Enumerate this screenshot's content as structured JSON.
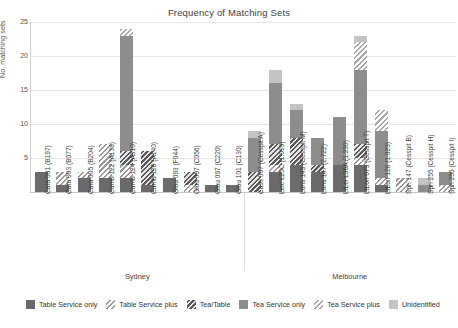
{
  "chart_data": {
    "type": "bar",
    "title": "Frequency of Matching Sets",
    "xlabel": "",
    "ylabel": "No. matching sets",
    "ylim": [
      0,
      25
    ],
    "yticks": [
      5,
      10,
      15,
      20,
      25
    ],
    "grid": true,
    "stacked": true,
    "legend_position": "bottom",
    "groups": [
      {
        "name": "Sydney",
        "start": 0,
        "end": 9
      },
      {
        "name": "Melbourne",
        "start": 10,
        "end": 19
      }
    ],
    "categories": [
      "Cara 001 (B197)",
      "Cara 003 (B077)",
      "Cara 005 (B204)",
      "Cumb 122 (A138)",
      "Cumb 124 (A310)",
      "Cumb 126 (A140)",
      "Glou 093 (F044)",
      "Glou 097 (C056)",
      "Glou 097 (C220)",
      "Glou 101 (C130)",
      "Cass 007 (Cesspit A)",
      "Leic L25C (1.010)",
      "Lons 143 (Cesspit M)",
      "Lons 147 (2.722)",
      "LtLei L36A (1.230)",
      "LtLon 073 (Cesspit T)",
      "LtLon 128 (1.023)",
      "Spri 147 (Cesspit B)",
      "Spri 255 (Cesspit H)",
      "Spri 255 (Cesspit I)"
    ],
    "series": [
      {
        "name": "Table Service only",
        "key": "ts_only",
        "color": "#6b6b6b",
        "values": [
          3,
          1,
          2,
          2,
          2,
          1,
          2,
          0,
          1,
          1,
          0,
          3,
          4,
          3,
          4,
          4,
          1,
          0,
          0,
          0
        ]
      },
      {
        "name": "Table Service plus",
        "key": "ts_plus",
        "color": "#ffffff",
        "values": [
          0,
          2,
          1,
          5,
          2,
          0,
          0,
          1,
          0,
          0,
          0,
          1,
          0,
          0,
          0,
          1,
          1,
          2,
          0,
          1
        ]
      },
      {
        "name": "Tea/Table",
        "key": "tea_table",
        "color": "#585858",
        "values": [
          0,
          0,
          0,
          0,
          2,
          5,
          0,
          2,
          0,
          0,
          3,
          3,
          4,
          1,
          0,
          2,
          0,
          0,
          0,
          0
        ]
      },
      {
        "name": "Tea Service only",
        "key": "tea_only",
        "color": "#8d8d8d",
        "values": [
          0,
          0,
          0,
          0,
          17,
          0,
          0,
          0,
          0,
          0,
          5,
          9,
          4,
          4,
          7,
          11,
          7,
          0,
          1,
          2
        ]
      },
      {
        "name": "Tea Service plus",
        "key": "tea_plus",
        "color": "#ffffff",
        "values": [
          0,
          0,
          0,
          0,
          1,
          0,
          0,
          0,
          0,
          0,
          0,
          0,
          0,
          0,
          0,
          4,
          3,
          0,
          0,
          0
        ]
      },
      {
        "name": "Unidentified",
        "key": "unid",
        "color": "#c4c4c4",
        "values": [
          0,
          0,
          0,
          0,
          0,
          0,
          0,
          0,
          0,
          0,
          1,
          2,
          1,
          0,
          0,
          1,
          0,
          0,
          1,
          0
        ]
      }
    ]
  },
  "legend": {
    "items": [
      {
        "label": "Table Service only",
        "fill": "f-ts-only"
      },
      {
        "label": "Table Service plus",
        "fill": "f-ts-plus"
      },
      {
        "label": "Tea/Table",
        "fill": "f-teatable"
      },
      {
        "label": "Tea Service only",
        "fill": "f-tea-only"
      },
      {
        "label": "Tea Service plus",
        "fill": "f-tea-plus"
      },
      {
        "label": "Unidentified",
        "fill": "f-unid"
      }
    ]
  }
}
